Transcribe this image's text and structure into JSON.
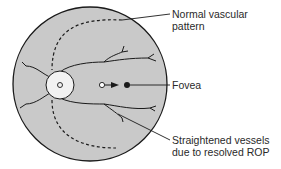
{
  "diagram": {
    "labels": {
      "normal_pattern_line1": "Normal vascular",
      "normal_pattern_line2": "pattern",
      "fovea": "Fovea",
      "straightened_line1": "Straightened vessels",
      "straightened_line2": "due to resolved ROP"
    },
    "colors": {
      "fundus_fill": "#c9c9c9",
      "disc_fill": "#f2f2f2",
      "stroke": "#1a1a1a"
    }
  }
}
